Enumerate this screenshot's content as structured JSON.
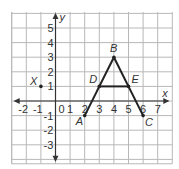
{
  "graph": {
    "axes": {
      "x_label": "x",
      "y_label": "y"
    },
    "x_ticks": [
      "-2",
      "-1",
      "0",
      "1",
      "2",
      "3",
      "4",
      "5",
      "6",
      "7"
    ],
    "y_ticks": [
      "5",
      "4",
      "3",
      "2",
      "1",
      "-1",
      "-2",
      "-3"
    ],
    "points": [
      {
        "name": "A",
        "x": 2,
        "y": -1
      },
      {
        "name": "B",
        "x": 4,
        "y": 3
      },
      {
        "name": "C",
        "x": 6,
        "y": -1
      },
      {
        "name": "D",
        "x": 3,
        "y": 1
      },
      {
        "name": "E",
        "x": 5,
        "y": 1
      },
      {
        "name": "X",
        "x": -1,
        "y": 1
      }
    ],
    "segments": [
      [
        "A",
        "B"
      ],
      [
        "B",
        "C"
      ],
      [
        "D",
        "E"
      ]
    ],
    "colors": {
      "grid": "#b8b8b8",
      "lines": "#222222",
      "axis": "#333333"
    }
  }
}
